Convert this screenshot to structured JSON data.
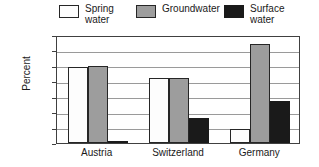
{
  "chart_data": {
    "type": "bar",
    "title": "",
    "xlabel": "",
    "ylabel": "Percent",
    "ylim": [
      0,
      70
    ],
    "ytick_step": 10,
    "yticks": [
      70,
      60,
      50,
      40,
      30,
      20,
      10,
      0
    ],
    "grid": true,
    "legend_position": "top",
    "categories": [
      "Austria",
      "Switzerland",
      "Germany"
    ],
    "series": [
      {
        "name": "Spring\nwater",
        "color": "#fdfdfd",
        "values": [
          49,
          42,
          9
        ]
      },
      {
        "name": "Groundwater",
        "color": "#9d9d9d",
        "values": [
          50,
          42,
          64
        ]
      },
      {
        "name": "Surface\nwater",
        "color": "#1a1a1a",
        "values": [
          1,
          16,
          27
        ]
      }
    ]
  }
}
